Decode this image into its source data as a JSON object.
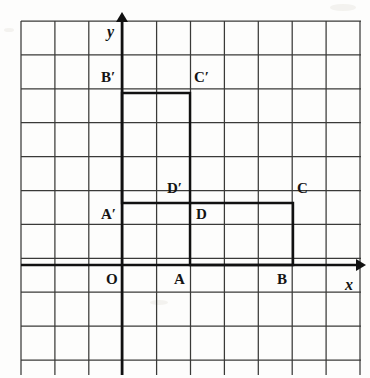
{
  "figure": {
    "kind": "coordinate-grid-geometry",
    "grid": {
      "left": 21,
      "top": 21,
      "right": 361,
      "bottom": 375,
      "spacing": 33.9,
      "columns": 10,
      "rows": 10,
      "line_color": "#3a3a38",
      "line_width": 1.25
    },
    "axes": {
      "origin": {
        "x": 122,
        "y": 265
      },
      "x_axis": {
        "from_x": 21,
        "to_x": 356,
        "y": 265,
        "arrow": true
      },
      "y_axis": {
        "x": 122,
        "from_y": 375,
        "to_y": 22,
        "arrow": true
      },
      "color": "#111111",
      "line_width": 2.6,
      "x_label": "x",
      "y_label": "y"
    },
    "shapes": [
      {
        "name": "rectangle-ABCD",
        "vertices": [
          "A",
          "B",
          "C",
          "D"
        ],
        "points": [
          [
            190,
            265
          ],
          [
            293,
            265
          ],
          [
            293,
            203
          ],
          [
            190,
            203
          ]
        ],
        "grid_coords": [
          [
            2,
            0
          ],
          [
            5,
            0
          ],
          [
            5,
            2
          ],
          [
            2,
            2
          ]
        ],
        "stroke": "#111111",
        "stroke_width": 2.4
      },
      {
        "name": "rectangle-A-prime-B-prime-C-prime-D-prime",
        "vertices": [
          "A'",
          "B'",
          "C'",
          "D'"
        ],
        "points": [
          [
            122,
            203
          ],
          [
            122,
            93
          ],
          [
            190,
            93
          ],
          [
            190,
            203
          ]
        ],
        "grid_coords": [
          [
            0,
            2
          ],
          [
            0,
            5
          ],
          [
            2,
            5
          ],
          [
            2,
            2
          ]
        ],
        "stroke": "#111111",
        "stroke_width": 2.4
      }
    ],
    "labels": [
      {
        "id": "origin",
        "text": "O",
        "prime": false,
        "x": 106,
        "y": 272
      },
      {
        "id": "point-a",
        "text": "A",
        "prime": false,
        "x": 174,
        "y": 272
      },
      {
        "id": "point-b",
        "text": "B",
        "prime": false,
        "x": 277,
        "y": 272
      },
      {
        "id": "point-c",
        "text": "C",
        "prime": false,
        "x": 297,
        "y": 181
      },
      {
        "id": "point-d",
        "text": "D",
        "prime": false,
        "x": 196,
        "y": 207
      },
      {
        "id": "point-a-prime",
        "text": "A",
        "prime": true,
        "x": 101,
        "y": 207
      },
      {
        "id": "point-b-prime",
        "text": "B",
        "prime": true,
        "x": 101,
        "y": 70
      },
      {
        "id": "point-c-prime",
        "text": "C",
        "prime": true,
        "x": 194,
        "y": 70
      },
      {
        "id": "point-d-prime",
        "text": "D",
        "prime": true,
        "x": 167,
        "y": 181
      },
      {
        "id": "axis-x",
        "text": "x",
        "prime": false,
        "italic": true,
        "x": 345,
        "y": 277
      },
      {
        "id": "axis-y",
        "text": "y",
        "prime": false,
        "italic": true,
        "x": 107,
        "y": 24
      }
    ]
  }
}
